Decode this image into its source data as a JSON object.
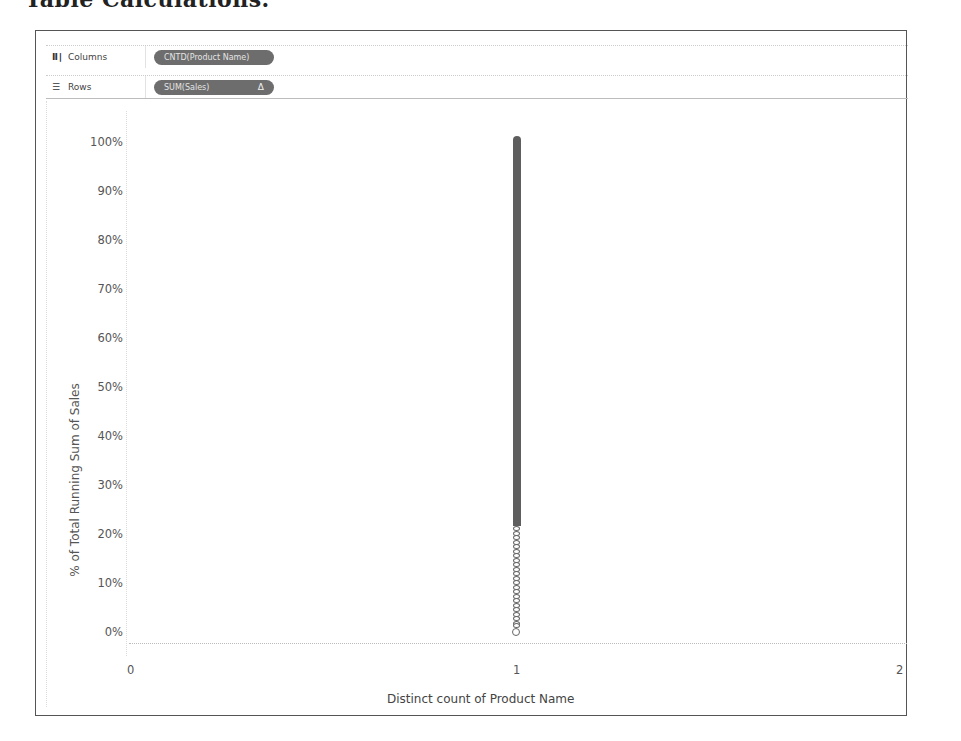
{
  "page": {
    "heading_fragment": "Table Calculations."
  },
  "shelves": {
    "columns": {
      "icon": "columns-icon",
      "label": "Columns",
      "pill": "CNTD(Product Name)"
    },
    "rows": {
      "icon": "rows-icon",
      "label": "Rows",
      "pill": "SUM(Sales)",
      "pill_badge": "Δ"
    }
  },
  "chart_data": {
    "type": "scatter",
    "title": "",
    "xlabel": "Distinct count of Product Name",
    "ylabel": "% of Total Running Sum of Sales",
    "x_ticks": [
      "0",
      "1",
      "2"
    ],
    "y_ticks": [
      "100%",
      "90%",
      "80%",
      "70%",
      "60%",
      "50%",
      "40%",
      "30%",
      "20%",
      "10%",
      "0%"
    ],
    "xlim": [
      0,
      2
    ],
    "ylim": [
      0,
      1
    ],
    "grid": false,
    "legend": null,
    "series": [
      {
        "name": "Products (running % of total sales)",
        "mark": "open circle",
        "color": "#666666",
        "x": 1,
        "y_range": [
          0.02,
          1.0
        ],
        "note": "Many overlapping marks stacked at x=1 forming a dense vertical line; sparse separated circles visible below ~20%"
      }
    ]
  },
  "colors": {
    "pill_bg": "#6d6d6d",
    "mark": "#5e5e5e",
    "frame_border": "#555555"
  }
}
